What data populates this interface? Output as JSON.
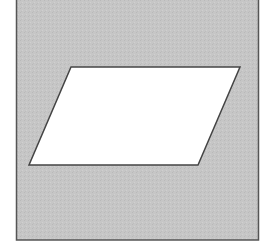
{
  "diagram": {
    "shape": "parallelogram",
    "background": {
      "fill": "#c6c6c6",
      "stroke": "#555555"
    },
    "frame": {
      "x": 16,
      "y": 0,
      "width": 243,
      "height": 240
    },
    "parallelogram": {
      "points": [
        [
          71,
          67
        ],
        [
          240,
          67
        ],
        [
          198,
          165
        ],
        [
          29,
          165
        ]
      ],
      "fill": "#ffffff",
      "stroke": "#444444"
    }
  }
}
